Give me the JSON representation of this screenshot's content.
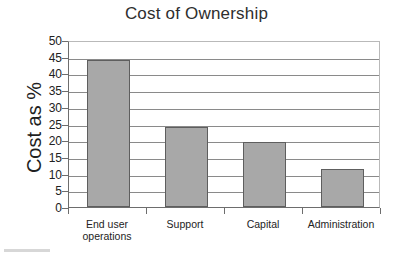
{
  "chart_data": {
    "type": "bar",
    "title": "Cost of Ownership",
    "xlabel": "",
    "ylabel": "Cost as %",
    "categories": [
      "End user operations",
      "Support",
      "Capital",
      "Administration"
    ],
    "category_lines": [
      [
        "End user",
        "operations"
      ],
      [
        "Support"
      ],
      [
        "Capital"
      ],
      [
        "Administration"
      ]
    ],
    "values": [
      44,
      24,
      19.5,
      11.5
    ],
    "ylim": [
      0,
      50
    ],
    "ytick_step": 5,
    "yticks": [
      50,
      45,
      40,
      35,
      30,
      25,
      20,
      15,
      10,
      5,
      0
    ],
    "ytick_labels": [
      "50",
      "45",
      "40",
      "35",
      "30",
      "25",
      "20",
      "15",
      "10",
      "5",
      "0"
    ],
    "grid": true,
    "grid_axis": "y",
    "legend": false,
    "legend_position": "none",
    "series": [
      {
        "name": "Cost as %",
        "values": [
          44,
          24,
          19.5,
          11.5
        ]
      }
    ],
    "colors": {
      "bar_fill": "#a8a8a8",
      "bar_border": "#5e5e5e",
      "gridline": "#8a8a8a",
      "axis": "#6d6d6d",
      "plot_border": "#b9b9b9",
      "text": "#232323",
      "background": "#ffffff"
    }
  }
}
